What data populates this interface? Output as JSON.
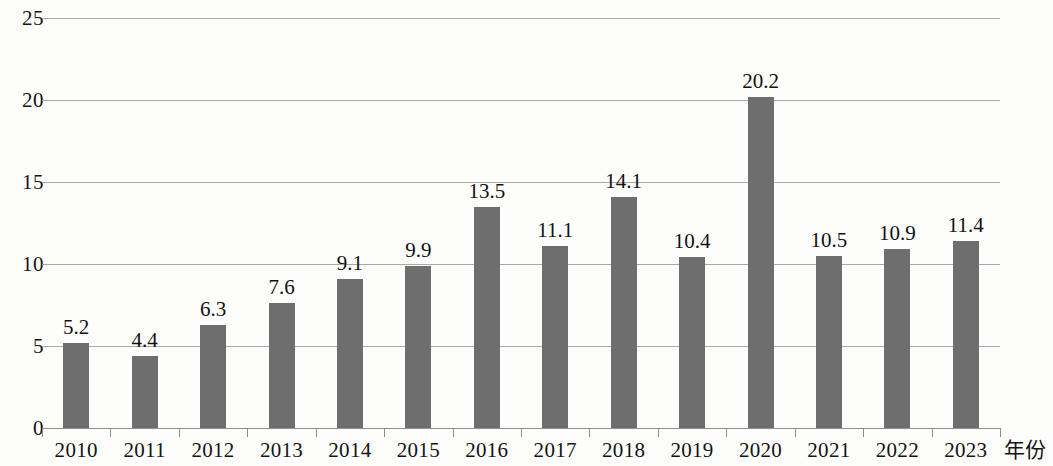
{
  "chart_data": {
    "type": "bar",
    "title": "",
    "subtitle": "",
    "xlabel": "年份",
    "ylabel": "",
    "categories": [
      "2010",
      "2011",
      "2012",
      "2013",
      "2014",
      "2015",
      "2016",
      "2017",
      "2018",
      "2019",
      "2020",
      "2021",
      "2022",
      "2023"
    ],
    "values": [
      5.2,
      4.4,
      6.3,
      7.6,
      9.1,
      9.9,
      13.5,
      11.1,
      14.1,
      10.4,
      20.2,
      10.5,
      10.9,
      11.4
    ],
    "data_labels": [
      "5.2",
      "4.4",
      "6.3",
      "7.6",
      "9.1",
      "9.9",
      "13.5",
      "11.1",
      "14.1",
      "10.4",
      "20.2",
      "10.5",
      "10.9",
      "11.4"
    ],
    "ylim": [
      0,
      25
    ],
    "ytick_values": [
      0,
      5,
      10,
      15,
      20,
      25
    ],
    "ytick_labels": [
      "0",
      "5",
      "10",
      "15",
      "20",
      "25"
    ],
    "grid": true,
    "grid_axis": "y",
    "legend": null,
    "legend_position": "none",
    "bar_color": "#6e6e6e",
    "gridline_color": "#a8a8a8",
    "axis_color": "#8f8f8f",
    "background_color": "#fdfdfc",
    "text_color": "#141414",
    "show_data_labels": true
  }
}
